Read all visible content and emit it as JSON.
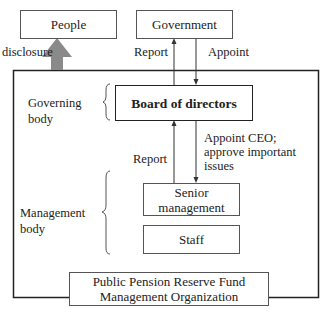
{
  "diagram": {
    "nodes": {
      "people": "People",
      "government": "Government",
      "board": "Board of directors",
      "senior_line1": "Senior",
      "senior_line2": "management",
      "staff": "Staff",
      "org_line1": "Public Pension Reserve Fund",
      "org_line2": "Management Organization"
    },
    "edges": {
      "disclosure": "disclosure",
      "report_gov": "Report",
      "appoint": "Appoint",
      "report_board": "Report",
      "appoint_ceo_1": "Appoint CEO;",
      "appoint_ceo_2": "approve important",
      "appoint_ceo_3": "issues"
    },
    "groups": {
      "governing_1": "Governing",
      "governing_2": "body",
      "management_1": "Management",
      "management_2": "body"
    },
    "colors": {
      "line": "#333333",
      "arrow_fill": "#8a8a8a"
    }
  }
}
